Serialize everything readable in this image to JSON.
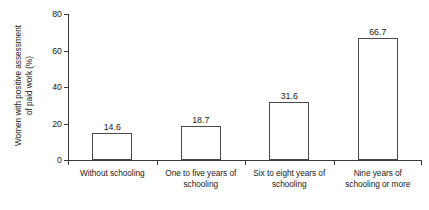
{
  "chart_data": {
    "type": "bar",
    "title": "",
    "subtitle": "",
    "xlabel": "",
    "ylabel": "Women with positive assessment\nof paid work (%)",
    "categories": [
      "Without schooling",
      "One to five years of\nschooling",
      "Six to eight years of\nschooling",
      "Nine years of\nschooling or more"
    ],
    "values": [
      14.6,
      18.7,
      31.6,
      66.7
    ],
    "value_labels": [
      "14.6",
      "18.7",
      "31.6",
      "66.7"
    ],
    "ylim": [
      0,
      80
    ],
    "ytick_values": [
      0,
      20,
      40,
      60,
      80
    ],
    "ytick_labels": [
      "0",
      "20",
      "40",
      "60",
      "80"
    ],
    "grid": false,
    "legend": false,
    "legend_position": "none",
    "bar_fill_color": "#ffffff",
    "bar_edge_color": "#4a4a4a",
    "axis_color": "#3a3a3a",
    "text_color": "#1a1a1a",
    "background_color": "#ffffff"
  }
}
